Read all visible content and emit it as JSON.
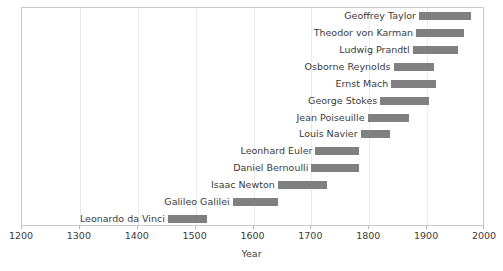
{
  "chart_data": {
    "type": "bar",
    "orientation": "horizontal",
    "subtype": "timeline-range",
    "title": "",
    "xlabel": "Year",
    "ylabel": "",
    "xlim": [
      1200,
      2000
    ],
    "xticks": [
      1200,
      1300,
      1400,
      1500,
      1600,
      1700,
      1800,
      1900,
      2000
    ],
    "xtick_labels": [
      "1200",
      "1300",
      "1400",
      "1500",
      "1600",
      "1700",
      "1800",
      "1900",
      "2000"
    ],
    "grid": "vertical-light",
    "legend": "none",
    "bar_color": "#808080",
    "categories": [
      "Geoffrey Taylor",
      "Theodor von Karman",
      "Ludwig Prandtl",
      "Osborne Reynolds",
      "Ernst Mach",
      "George Stokes",
      "Jean Poiseuille",
      "Louis Navier",
      "Leonhard Euler",
      "Daniel Bernoulli",
      "Isaac Newton",
      "Galileo Galilei",
      "Leonardo da Vinci"
    ],
    "ranges": [
      {
        "label": "Geoffrey Taylor",
        "start": 1886,
        "end": 1975
      },
      {
        "label": "Theodor von Karman",
        "start": 1881,
        "end": 1963
      },
      {
        "label": "Ludwig Prandtl",
        "start": 1875,
        "end": 1953
      },
      {
        "label": "Osborne Reynolds",
        "start": 1842,
        "end": 1912
      },
      {
        "label": "Ernst Mach",
        "start": 1838,
        "end": 1916
      },
      {
        "label": "George Stokes",
        "start": 1819,
        "end": 1903
      },
      {
        "label": "Jean Poiseuille",
        "start": 1797,
        "end": 1869
      },
      {
        "label": "Louis Navier",
        "start": 1785,
        "end": 1836
      },
      {
        "label": "Leonhard Euler",
        "start": 1707,
        "end": 1783
      },
      {
        "label": "Daniel Bernoulli",
        "start": 1700,
        "end": 1782
      },
      {
        "label": "Isaac Newton",
        "start": 1642,
        "end": 1727
      },
      {
        "label": "Galileo Galilei",
        "start": 1564,
        "end": 1642
      },
      {
        "label": "Leonardo da Vinci",
        "start": 1452,
        "end": 1519
      }
    ]
  }
}
